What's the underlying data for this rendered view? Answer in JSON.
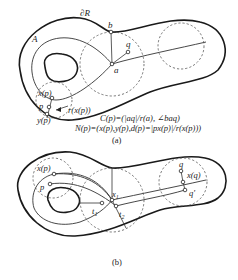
{
  "figure_a": {
    "caption": "(a)",
    "labels": {
      "boundary": "∂R",
      "axis_A": "A",
      "b": "b",
      "q": "q",
      "a": "a",
      "xp": "x(p)",
      "p": "p",
      "yp": "y(p)",
      "rxp": "r(x(p))"
    },
    "formulas": {
      "C": "C(p)=(|aq|/r(a), ∠baq)",
      "N": "N(p)=(x(p),y(p),d(p)=|px(p)|/r(x(p)))"
    }
  },
  "figure_b": {
    "caption": "(b)",
    "labels": {
      "xp": "x(p)",
      "p": "p",
      "x1": "x",
      "x1_sub": "1",
      "t1": "t",
      "t1_sub": "1",
      "t2": "t",
      "t2_sub": "2",
      "q": "q",
      "xq": "x(q)",
      "qprime": "q'"
    }
  }
}
